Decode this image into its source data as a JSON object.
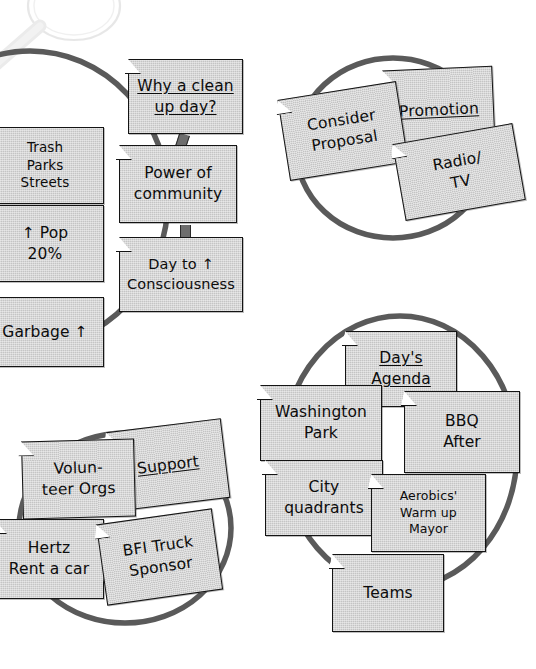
{
  "page": {
    "background_color": "#ffffff",
    "note_fill_color": "#cfcfcf",
    "note_border_color": "#141414",
    "loop_stroke_color": "#5a5a5a",
    "text_color": "#0c0c0c",
    "watermark": "magnifying-glass"
  },
  "clusters": [
    {
      "id": "why-a-clean-up-day",
      "heading": "Why a clean\nup day?",
      "notes": [
        "Trash\nParks\nStreets",
        "↑ Pop\n20%",
        "Garbage ↑",
        "Power of\ncommunity",
        "Day to ↑\nConsciousness"
      ]
    },
    {
      "id": "promotion",
      "heading": "Promotion",
      "notes": [
        "Consider\nProposal",
        "Radio/\nTV"
      ]
    },
    {
      "id": "support",
      "heading": "Support",
      "notes": [
        "Volun-\nteer Orgs",
        "Hertz\nRent a car",
        "BFI Truck\nSponsor"
      ]
    },
    {
      "id": "days-agenda",
      "heading": "Day's\nAgenda",
      "notes": [
        "Washington\nPark",
        "BBQ\nAfter",
        "City\nquadrants",
        "Aerobics'\nWarm up\nMayor",
        "Teams"
      ]
    }
  ],
  "notes": {
    "why_clean_up_day": "Why a clean\nup day?",
    "trash_parks_streets": "Trash\nParks\nStreets",
    "pop_20": "↑ Pop\n20%",
    "garbage": "Garbage ↑",
    "power_of_community": "Power of\ncommunity",
    "day_to_consciousness": "Day to ↑\nConsciousness",
    "promotion": "Promotion",
    "consider_proposal": "Consider\nProposal",
    "radio_tv": "Radio/\nTV",
    "support": "Support",
    "volunteer_orgs": "Volun-\nteer Orgs",
    "hertz_rent_a_car": "Hertz\nRent a car",
    "bfi_truck_sponsor": "BFI Truck\nSponsor",
    "days_agenda": "Day's\nAgenda",
    "washington_park": "Washington\nPark",
    "bbq_after": "BBQ\nAfter",
    "city_quadrants": "City\nquadrants",
    "aerobics_warm_up_mayor": "Aerobics'\nWarm up\nMayor",
    "teams": "Teams"
  }
}
